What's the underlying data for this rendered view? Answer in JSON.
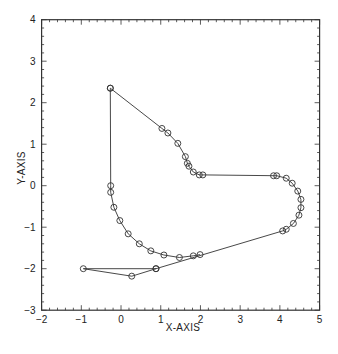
{
  "chart_data": {
    "type": "line",
    "title": "",
    "xlabel": "X-AXIS",
    "ylabel": "Y-AXIS",
    "xlim": [
      -2,
      5
    ],
    "ylim": [
      -3,
      4
    ],
    "xticks": [
      -2,
      -1,
      0,
      1,
      2,
      3,
      4,
      5
    ],
    "yticks": [
      -3,
      -2,
      -1,
      0,
      1,
      2,
      3,
      4
    ],
    "grid": false,
    "legend": null,
    "marker": "circle-open",
    "series": [
      {
        "name": "main-path",
        "points": [
          [
            -0.27,
            2.35
          ],
          [
            1.03,
            1.38
          ],
          [
            1.18,
            1.27
          ],
          [
            1.43,
            1.02
          ],
          [
            1.62,
            0.7
          ],
          [
            1.67,
            0.54
          ],
          [
            1.71,
            0.47
          ],
          [
            1.82,
            0.33
          ],
          [
            1.97,
            0.26
          ],
          [
            2.06,
            0.26
          ],
          [
            3.84,
            0.24
          ],
          [
            3.92,
            0.24
          ],
          [
            4.16,
            0.18
          ],
          [
            4.31,
            0.06
          ],
          [
            4.45,
            -0.13
          ],
          [
            4.53,
            -0.33
          ],
          [
            4.53,
            -0.53
          ],
          [
            4.48,
            -0.71
          ],
          [
            4.34,
            -0.91
          ],
          [
            4.16,
            -1.05
          ],
          [
            4.07,
            -1.09
          ],
          [
            0.88,
            -2.0
          ],
          [
            -0.95,
            -2.0
          ],
          [
            0.27,
            -2.18
          ],
          [
            0.88,
            -2.0
          ]
        ]
      },
      {
        "name": "arc-path",
        "points": [
          [
            1.99,
            -1.66
          ],
          [
            1.82,
            -1.69
          ],
          [
            1.47,
            -1.73
          ],
          [
            1.08,
            -1.67
          ],
          [
            0.75,
            -1.57
          ],
          [
            0.46,
            -1.4
          ],
          [
            0.18,
            -1.16
          ],
          [
            -0.03,
            -0.84
          ],
          [
            -0.18,
            -0.52
          ],
          [
            -0.26,
            -0.16
          ],
          [
            -0.26,
            0.0
          ],
          [
            -0.27,
            2.35
          ]
        ]
      }
    ]
  },
  "labels": {
    "xlabel": "X-AXIS",
    "ylabel": "Y-AXIS"
  }
}
